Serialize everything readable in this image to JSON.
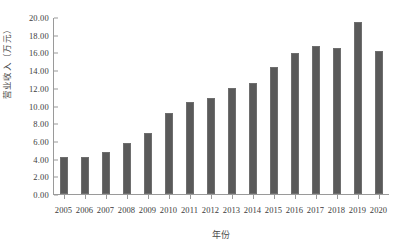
{
  "chart_data": {
    "type": "bar",
    "title": "",
    "xlabel": "年份",
    "ylabel": "营业收入（万元）",
    "categories": [
      "2005",
      "2006",
      "2007",
      "2008",
      "2009",
      "2010",
      "2011",
      "2012",
      "2013",
      "2014",
      "2015",
      "2016",
      "2017",
      "2018",
      "2019",
      "2020"
    ],
    "values": [
      4.2,
      4.15,
      4.75,
      5.75,
      6.95,
      9.1,
      10.35,
      10.8,
      11.95,
      12.6,
      14.3,
      15.9,
      16.75,
      16.5,
      19.4,
      16.2
    ],
    "ylim": [
      0,
      20
    ],
    "ytick_step": 2,
    "ytick_labels": [
      "0.00",
      "2.00",
      "4.00",
      "6.00",
      "8.00",
      "10.00",
      "12.00",
      "14.00",
      "16.00",
      "18.00",
      "20.00"
    ],
    "ytick_values": [
      0,
      2,
      4,
      6,
      8,
      10,
      12,
      14,
      16,
      18,
      20
    ],
    "grid": false,
    "legend": false,
    "bar_color": "#5a5a5a",
    "axis_color": "#9a9a9a"
  }
}
